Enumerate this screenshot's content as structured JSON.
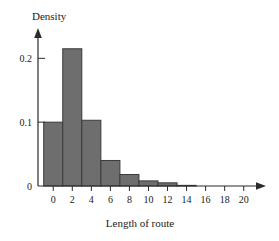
{
  "chart_data": {
    "type": "bar",
    "title": "",
    "subtitle": "",
    "xlabel": "Length of route",
    "ylabel": "Density",
    "grid": false,
    "legend": "none",
    "xlim": [
      -1.6,
      21.5
    ],
    "ylim": [
      0,
      0.235
    ],
    "x_ticks": [
      0,
      2,
      4,
      6,
      8,
      10,
      12,
      14,
      16,
      18,
      20
    ],
    "x_tick_labels": [
      "0",
      "2",
      "4",
      "6",
      "8",
      "10",
      "12",
      "14",
      "16",
      "18",
      "20"
    ],
    "y_ticks": [
      0,
      0.1,
      0.2
    ],
    "y_tick_labels": [
      "0",
      "0.1",
      "0.2"
    ],
    "bin_edges": [
      -1,
      1,
      3,
      5,
      7,
      9,
      11,
      13,
      15
    ],
    "categories": [
      "-1 to 1",
      "1 to 3",
      "3 to 5",
      "5 to 7",
      "7 to 9",
      "9 to 11",
      "11 to 13",
      "13 to 15"
    ],
    "values": [
      0.1,
      0.215,
      0.103,
      0.04,
      0.018,
      0.008,
      0.005,
      0.001
    ],
    "bar_color": "#6e6e6e",
    "bar_edge_color": "#3a3a3a",
    "axis_color": "#2b2b2b"
  },
  "axes": {
    "y_axis_label": "Density",
    "x_axis_label": "Length of route",
    "y_tick_0": "0",
    "y_tick_1": "0.1",
    "y_tick_2": "0.2"
  },
  "x_tick_text": {
    "t0": "0",
    "t1": "2",
    "t2": "4",
    "t3": "6",
    "t4": "8",
    "t5": "10",
    "t6": "12",
    "t7": "14",
    "t8": "16",
    "t9": "18",
    "t10": "20"
  }
}
